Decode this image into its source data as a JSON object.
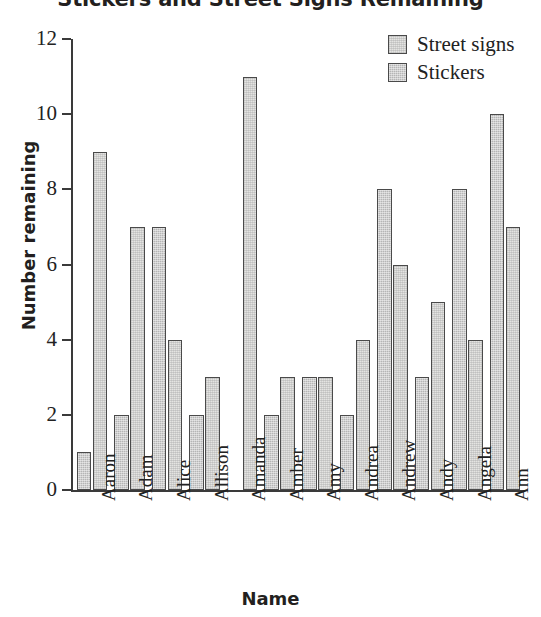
{
  "chart_data": {
    "type": "bar",
    "title": "Stickers and Street Signs Remaining",
    "xlabel": "Name",
    "ylabel": "Number remaining",
    "ylim": [
      0,
      12
    ],
    "yticks": [
      0,
      2,
      4,
      6,
      8,
      10,
      12
    ],
    "grid": false,
    "legend_position": "top-right",
    "categories": [
      "Aaron",
      "Adam",
      "Alice",
      "Allison",
      "Amanda",
      "Amber",
      "Amy",
      "Andrea",
      "Andrew",
      "Andy",
      "Angela",
      "Ann"
    ],
    "series": [
      {
        "name": "Stickers",
        "color": "#b5b5b5",
        "values": [
          1,
          2,
          7,
          2,
          0,
          2,
          3,
          2,
          8,
          3,
          8,
          10
        ]
      },
      {
        "name": "Street signs",
        "color": "#e4e4e2",
        "values": [
          9,
          7,
          4,
          3,
          11,
          3,
          3,
          4,
          6,
          5,
          4,
          7
        ]
      }
    ]
  },
  "legend": {
    "entries": [
      {
        "label": "Street signs",
        "swatch": "streetsigns"
      },
      {
        "label": "Stickers",
        "swatch": "stickers"
      }
    ]
  }
}
